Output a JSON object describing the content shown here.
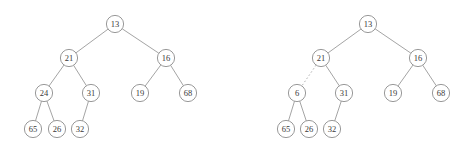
{
  "figure": {
    "background_color": "#ffffff",
    "node_stroke_color": "#8d8d8d",
    "edge_stroke_color": "#9a9a9a",
    "label_color": "#3a3a3a",
    "node_radius": 8.6
  },
  "diagrams": [
    {
      "name": "left-tree",
      "caption": "",
      "nodes": [
        {
          "id": "L-13",
          "label": "13",
          "x": 115,
          "y": 24
        },
        {
          "id": "L-21",
          "label": "21",
          "x": 69,
          "y": 58
        },
        {
          "id": "L-16",
          "label": "16",
          "x": 166,
          "y": 58
        },
        {
          "id": "L-24",
          "label": "24",
          "x": 44,
          "y": 93
        },
        {
          "id": "L-31",
          "label": "31",
          "x": 91,
          "y": 93
        },
        {
          "id": "L-19",
          "label": "19",
          "x": 140,
          "y": 93
        },
        {
          "id": "L-68",
          "label": "68",
          "x": 188,
          "y": 93
        },
        {
          "id": "L-65",
          "label": "65",
          "x": 33,
          "y": 129
        },
        {
          "id": "L-26",
          "label": "26",
          "x": 57,
          "y": 129
        },
        {
          "id": "L-32",
          "label": "32",
          "x": 80,
          "y": 129
        }
      ],
      "edges": [
        {
          "from": "L-13",
          "to": "L-21",
          "style": "solid"
        },
        {
          "from": "L-13",
          "to": "L-16",
          "style": "solid"
        },
        {
          "from": "L-21",
          "to": "L-24",
          "style": "solid"
        },
        {
          "from": "L-21",
          "to": "L-31",
          "style": "solid"
        },
        {
          "from": "L-16",
          "to": "L-19",
          "style": "solid"
        },
        {
          "from": "L-16",
          "to": "L-68",
          "style": "solid"
        },
        {
          "from": "L-24",
          "to": "L-65",
          "style": "solid"
        },
        {
          "from": "L-24",
          "to": "L-26",
          "style": "solid"
        },
        {
          "from": "L-31",
          "to": "L-32",
          "style": "solid"
        }
      ]
    },
    {
      "name": "right-tree",
      "caption": "",
      "nodes": [
        {
          "id": "R-13",
          "label": "13",
          "x": 368,
          "y": 24
        },
        {
          "id": "R-21",
          "label": "21",
          "x": 321,
          "y": 58
        },
        {
          "id": "R-16",
          "label": "16",
          "x": 418,
          "y": 58
        },
        {
          "id": "R-6",
          "label": "6",
          "x": 297,
          "y": 93
        },
        {
          "id": "R-31",
          "label": "31",
          "x": 344,
          "y": 93
        },
        {
          "id": "R-19",
          "label": "19",
          "x": 393,
          "y": 93
        },
        {
          "id": "R-68",
          "label": "68",
          "x": 441,
          "y": 93
        },
        {
          "id": "R-65",
          "label": "65",
          "x": 286,
          "y": 129
        },
        {
          "id": "R-26",
          "label": "26",
          "x": 309,
          "y": 129
        },
        {
          "id": "R-32",
          "label": "32",
          "x": 332,
          "y": 129
        }
      ],
      "edges": [
        {
          "from": "R-13",
          "to": "R-21",
          "style": "solid"
        },
        {
          "from": "R-13",
          "to": "R-16",
          "style": "solid"
        },
        {
          "from": "R-21",
          "to": "R-6",
          "style": "dashed"
        },
        {
          "from": "R-21",
          "to": "R-31",
          "style": "solid"
        },
        {
          "from": "R-16",
          "to": "R-19",
          "style": "solid"
        },
        {
          "from": "R-16",
          "to": "R-68",
          "style": "solid"
        },
        {
          "from": "R-6",
          "to": "R-65",
          "style": "solid"
        },
        {
          "from": "R-6",
          "to": "R-26",
          "style": "solid"
        },
        {
          "from": "R-31",
          "to": "R-32",
          "style": "solid"
        }
      ]
    }
  ]
}
